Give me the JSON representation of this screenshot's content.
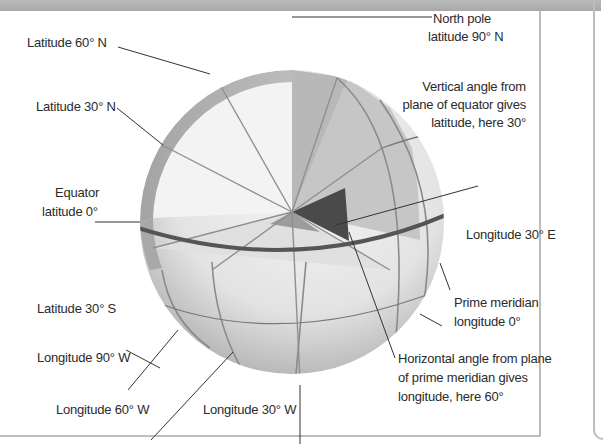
{
  "diagram": {
    "colors": {
      "band": "#aaaaaa",
      "sphere_light": "#f1f1f1",
      "sphere_mid": "#c8c8c8",
      "sphere_dark": "#9a9a9a",
      "wedge_dark": "#4a4a4a",
      "equator": "#555555",
      "leader": "#333333",
      "text": "#2b2b2b"
    },
    "labels": {
      "lat60n": "Latitude 60° N",
      "lat30n": "Latitude 30° N",
      "equator_line1": "Equator",
      "equator_line2": "latitude 0°",
      "lat30s": "Latitude 30° S",
      "lon90w": "Longitude 90° W",
      "lon60w": "Longitude 60° W",
      "lon30w": "Longitude 30° W",
      "north_pole_line1": "North pole",
      "north_pole_line2": "latitude 90° N",
      "vertical_angle_line1": "Vertical angle from",
      "vertical_angle_line2": "plane of equator gives",
      "vertical_angle_line3": "latitude, here 30°",
      "lon30e": "Longitude 30° E",
      "prime_meridian_line1": "Prime meridian",
      "prime_meridian_line2": "longitude 0°",
      "horizontal_angle_line1": "Horizontal angle from plane",
      "horizontal_angle_line2": "of prime meridian gives",
      "horizontal_angle_line3": "longitude, here 60°"
    }
  }
}
